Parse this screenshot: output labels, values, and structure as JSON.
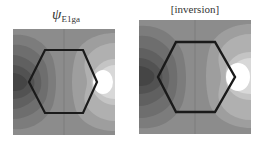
{
  "figure": {
    "panels": [
      {
        "id": "left",
        "title_symbol": "ψ",
        "title_subscript": "E1ga",
        "background": "#8c8c8c",
        "hexagon_stroke": "#1a1a1a"
      },
      {
        "id": "right",
        "title": "[inversion]",
        "background": "#8c8c8c",
        "hexagon_stroke": "#1a1a1a"
      }
    ],
    "colors": {
      "dark_lobe": [
        "#7c7c7c",
        "#6e6e6e",
        "#606060",
        "#525252",
        "#454545"
      ],
      "light_lobe": [
        "#9e9e9e",
        "#b0b0b0",
        "#c4c4c4",
        "#d8d8d8",
        "#ffffff"
      ],
      "midline": "#7a7a7a"
    }
  }
}
